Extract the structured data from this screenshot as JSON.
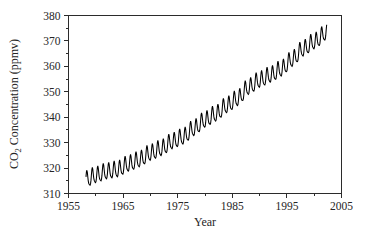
{
  "chart_data": {
    "type": "line",
    "title": "",
    "xlabel": "Year",
    "ylabel": "CO2 Concentration (ppmv)",
    "ylabel_parts": {
      "prefix": "CO",
      "subscript": "2",
      "suffix": " Concentration (ppmv)"
    },
    "xlim": [
      1955,
      2005
    ],
    "ylim": [
      310,
      380
    ],
    "xticks": [
      1955,
      1965,
      1975,
      1985,
      1995,
      2005
    ],
    "xtick_labels": [
      "1955",
      "1965",
      "1975",
      "1985",
      "1995",
      "2005"
    ],
    "x_minor_tick_interval": 5,
    "yticks": [
      310,
      320,
      330,
      340,
      350,
      360,
      370,
      380
    ],
    "ytick_labels": [
      "310",
      "320",
      "330",
      "340",
      "350",
      "360",
      "370",
      "380"
    ],
    "y_minor_tick_interval": 5,
    "grid": false,
    "legend": null,
    "line_color": "#000000",
    "frame_color": "#2b2b2b",
    "background_color": "#ffffff",
    "series": [
      {
        "name": "Mauna Loa monthly mean CO2",
        "x_start": 1958.2,
        "x_end": 2002.3,
        "samples_per_year": 12,
        "description": "Keeling Curve: rising trend with annual seasonal sawtooth",
        "trend_anchors": [
          {
            "year": 1958.2,
            "value": 315.3
          },
          {
            "year": 1960.0,
            "value": 316.9
          },
          {
            "year": 1962.0,
            "value": 318.4
          },
          {
            "year": 1964.0,
            "value": 319.2
          },
          {
            "year": 1966.0,
            "value": 321.4
          },
          {
            "year": 1968.0,
            "value": 323.1
          },
          {
            "year": 1970.0,
            "value": 325.7
          },
          {
            "year": 1972.0,
            "value": 327.5
          },
          {
            "year": 1974.0,
            "value": 330.2
          },
          {
            "year": 1976.0,
            "value": 332.1
          },
          {
            "year": 1978.0,
            "value": 335.4
          },
          {
            "year": 1980.0,
            "value": 338.7
          },
          {
            "year": 1982.0,
            "value": 341.1
          },
          {
            "year": 1984.0,
            "value": 344.4
          },
          {
            "year": 1986.0,
            "value": 347.2
          },
          {
            "year": 1988.0,
            "value": 351.6
          },
          {
            "year": 1990.0,
            "value": 354.4
          },
          {
            "year": 1992.0,
            "value": 356.4
          },
          {
            "year": 1994.0,
            "value": 358.8
          },
          {
            "year": 1996.0,
            "value": 362.6
          },
          {
            "year": 1998.0,
            "value": 366.7
          },
          {
            "year": 2000.0,
            "value": 369.5
          },
          {
            "year": 2002.3,
            "value": 373.2
          }
        ],
        "seasonal_amplitude_ppmv": 3.1,
        "seasonal_peak_month": 5,
        "y_min_observed": 313.2,
        "y_max_observed": 374.0
      }
    ]
  },
  "figure": {
    "width": 371,
    "height": 239
  }
}
